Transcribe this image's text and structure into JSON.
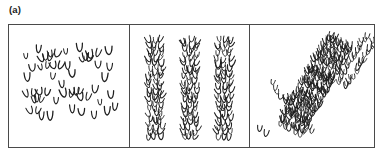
{
  "figure": {
    "panel_label": "(a)",
    "glyph_name": "seedling-sprout-glyph",
    "stroke_color": "#1f1f1f",
    "frame_color": "#4a4a4a",
    "background_color": "#ffffff"
  },
  "subpanels": [
    {
      "id": "random",
      "name": "random-dispersion-subpanel",
      "pattern": "random",
      "description": "Individual sprouts and small clumps scattered irregularly across the plot"
    },
    {
      "id": "rows",
      "name": "regular-rows-subpanel",
      "pattern": "regular-vertical-rows",
      "description": "Three dense evenly spaced vertical rows of sprouts"
    },
    {
      "id": "bands",
      "name": "diagonal-bands-subpanel",
      "pattern": "aggregated-diagonal-bands",
      "description": "Sprouts aggregated into three diagonal bands running upper-right to lower-left plus one small outlying clump"
    }
  ],
  "chart_data": {
    "type": "scatter",
    "title": "(a)",
    "xlabel": "",
    "ylabel": "",
    "grid": false,
    "legend": null,
    "panels": [
      {
        "name": "random",
        "xlim": [
          0,
          118
        ],
        "ylim": [
          0,
          124
        ],
        "n_points": 38,
        "points": [
          {
            "x": 16,
            "y": 34,
            "size": 1
          },
          {
            "x": 28,
            "y": 28,
            "size": 1
          },
          {
            "x": 36,
            "y": 36,
            "size": 3
          },
          {
            "x": 44,
            "y": 31,
            "size": 2
          },
          {
            "x": 23,
            "y": 47,
            "size": 1
          },
          {
            "x": 34,
            "y": 44,
            "size": 2
          },
          {
            "x": 47,
            "y": 43,
            "size": 2
          },
          {
            "x": 56,
            "y": 30,
            "size": 1
          },
          {
            "x": 58,
            "y": 45,
            "size": 1
          },
          {
            "x": 70,
            "y": 27,
            "size": 1
          },
          {
            "x": 76,
            "y": 36,
            "size": 3
          },
          {
            "x": 84,
            "y": 32,
            "size": 2
          },
          {
            "x": 88,
            "y": 44,
            "size": 1
          },
          {
            "x": 99,
            "y": 30,
            "size": 1
          },
          {
            "x": 100,
            "y": 46,
            "size": 1
          },
          {
            "x": 17,
            "y": 57,
            "size": 1
          },
          {
            "x": 42,
            "y": 55,
            "size": 1
          },
          {
            "x": 63,
            "y": 53,
            "size": 1
          },
          {
            "x": 94,
            "y": 56,
            "size": 1
          },
          {
            "x": 20,
            "y": 72,
            "size": 2
          },
          {
            "x": 27,
            "y": 78,
            "size": 3
          },
          {
            "x": 33,
            "y": 70,
            "size": 2
          },
          {
            "x": 24,
            "y": 90,
            "size": 2
          },
          {
            "x": 31,
            "y": 95,
            "size": 1
          },
          {
            "x": 46,
            "y": 79,
            "size": 1
          },
          {
            "x": 57,
            "y": 73,
            "size": 2
          },
          {
            "x": 66,
            "y": 70,
            "size": 3
          },
          {
            "x": 74,
            "y": 76,
            "size": 2
          },
          {
            "x": 62,
            "y": 88,
            "size": 1
          },
          {
            "x": 72,
            "y": 92,
            "size": 1
          },
          {
            "x": 85,
            "y": 69,
            "size": 1
          },
          {
            "x": 90,
            "y": 80,
            "size": 1
          },
          {
            "x": 101,
            "y": 74,
            "size": 1
          },
          {
            "x": 97,
            "y": 90,
            "size": 1
          },
          {
            "x": 104,
            "y": 86,
            "size": 1
          },
          {
            "x": 40,
            "y": 96,
            "size": 1
          },
          {
            "x": 84,
            "y": 95,
            "size": 1
          },
          {
            "x": 52,
            "y": 64,
            "size": 1
          }
        ]
      },
      {
        "name": "rows",
        "xlim": [
          0,
          118
        ],
        "ylim": [
          0,
          124
        ],
        "row_centers_x": [
          25,
          60,
          94
        ],
        "row_top_y": 18,
        "row_bottom_y": 116,
        "row_width": 20,
        "glyphs_per_row": 22
      },
      {
        "name": "bands",
        "xlim": [
          0,
          124
        ],
        "ylim": [
          0,
          124
        ],
        "bands": [
          {
            "name": "thin-band",
            "x1": 22,
            "y1": 62,
            "x2": 60,
            "y2": 110,
            "width": 7,
            "n_points": 14
          },
          {
            "name": "wide-band",
            "x1": 90,
            "y1": 18,
            "x2": 40,
            "y2": 108,
            "width": 24,
            "n_points": 46
          },
          {
            "name": "upper-right-band",
            "x1": 120,
            "y1": 16,
            "x2": 92,
            "y2": 62,
            "width": 10,
            "n_points": 16
          },
          {
            "name": "outlier-clump",
            "x1": 10,
            "y1": 106,
            "x2": 14,
            "y2": 112,
            "width": 5,
            "n_points": 2
          }
        ]
      }
    ]
  }
}
